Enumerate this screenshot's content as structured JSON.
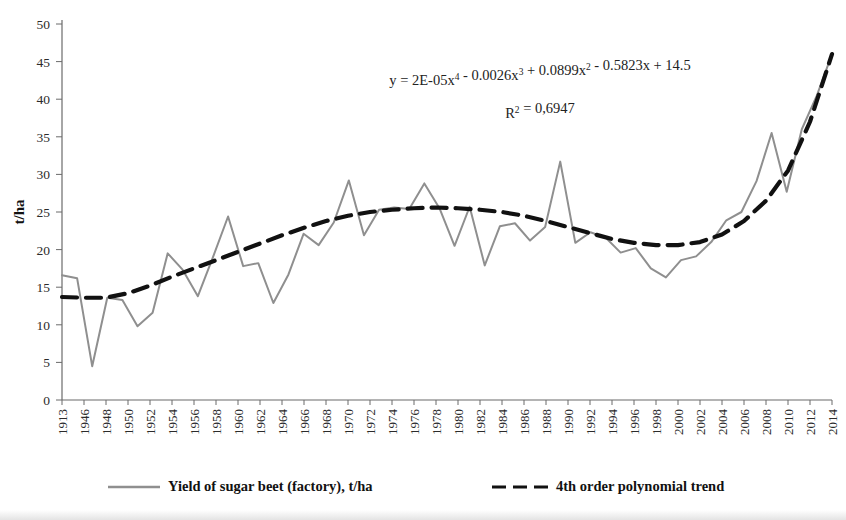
{
  "chart_data": {
    "type": "line",
    "title": "",
    "xlabel": "",
    "ylabel": "t/ha",
    "ylim": [
      0,
      50
    ],
    "ytick_step": 5,
    "yticks": [
      0,
      5,
      10,
      15,
      20,
      25,
      30,
      35,
      40,
      45,
      50
    ],
    "grid": false,
    "legend_position": "bottom",
    "categories": [
      "1913",
      "1946",
      "1948",
      "1950",
      "1952",
      "1954",
      "1956",
      "1958",
      "1960",
      "1962",
      "1964",
      "1966",
      "1968",
      "1970",
      "1972",
      "1974",
      "1976",
      "1978",
      "1980",
      "1982",
      "1984",
      "1986",
      "1988",
      "1990",
      "1992",
      "1994",
      "1996",
      "1998",
      "2000",
      "2002",
      "2004",
      "2006",
      "2008",
      "2010",
      "2012",
      "2014"
    ],
    "series": [
      {
        "name": "Yield of sugar beet (factory), t/ha",
        "color": "#8f8f8f",
        "style": "solid",
        "values": [
          16.6,
          16.2,
          4.5,
          13.6,
          13.3,
          9.8,
          11.6,
          19.5,
          17.3,
          13.8,
          19.0,
          24.4,
          17.8,
          18.2,
          12.9,
          16.7,
          22.1,
          20.6,
          23.6,
          29.2,
          21.9,
          25.3,
          25.6,
          25.4,
          28.8,
          25.5,
          20.5,
          25.7,
          17.9,
          23.1,
          23.5,
          21.2,
          23.0,
          31.7,
          20.9,
          22.3
        ]
      },
      {
        "name": "4th order polynomial trend",
        "color": "#111111",
        "style": "dashed",
        "values": [
          13.7,
          13.6,
          13.6,
          14.2,
          15.2,
          16.4,
          17.5,
          18.6,
          19.7,
          20.8,
          21.9,
          22.9,
          23.8,
          24.5,
          25.0,
          25.3,
          25.5,
          25.6,
          25.5,
          25.3,
          25.0,
          24.5,
          23.8,
          23.0,
          22.2,
          21.4,
          20.9,
          20.6,
          20.6,
          21.0,
          22.0,
          23.8,
          26.5,
          30.5,
          37.0,
          46.0
        ]
      }
    ],
    "series_extra_note": "observed series continues with additional points beyond listed even-year ticks",
    "observed_full": [
      16.6,
      16.2,
      4.5,
      13.6,
      13.3,
      9.8,
      11.6,
      19.5,
      17.3,
      13.8,
      19.0,
      24.4,
      17.8,
      18.2,
      12.9,
      16.7,
      22.1,
      20.6,
      23.6,
      29.2,
      21.9,
      25.3,
      25.6,
      25.4,
      28.8,
      25.5,
      20.5,
      25.7,
      17.9,
      23.1,
      23.5,
      21.2,
      23.0,
      31.7,
      20.9,
      22.3,
      21.6,
      19.6,
      20.2,
      17.5,
      16.3,
      18.6,
      19.1,
      21.0,
      23.9,
      25.0,
      29.1,
      35.5,
      27.7,
      36.0,
      40.5,
      46.0
    ],
    "annotations": {
      "equation": {
        "line1_parts": [
          {
            "text": "y = 2E-05x",
            "sup": false
          },
          {
            "text": "4",
            "sup": true
          },
          {
            "text": " - 0.0026x",
            "sup": false
          },
          {
            "text": "3",
            "sup": true
          },
          {
            "text": " + 0.0899x",
            "sup": false
          },
          {
            "text": "2",
            "sup": true
          },
          {
            "text": " - 0.5823x + 14.5",
            "sup": false
          }
        ],
        "line1_plain": "y = 2E-05x4 - 0.0026x3 + 0.0899x2 - 0.5823x + 14.5",
        "line2_parts": [
          {
            "text": "R",
            "sup": false
          },
          {
            "text": "2",
            "sup": true
          },
          {
            "text": " = 0,6947",
            "sup": false
          }
        ],
        "line2_plain": "R2 = 0,6947"
      }
    }
  },
  "axis": {
    "y_title": "t/ha",
    "y_tick_labels": [
      "50",
      "45",
      "40",
      "35",
      "30",
      "25",
      "20",
      "15",
      "10",
      "5",
      "0"
    ],
    "x_tick_labels": [
      "1913",
      "1946",
      "1948",
      "1950",
      "1952",
      "1954",
      "1956",
      "1958",
      "1960",
      "1962",
      "1964",
      "1966",
      "1968",
      "1970",
      "1972",
      "1974",
      "1976",
      "1978",
      "1980",
      "1982",
      "1984",
      "1986",
      "1988",
      "1990",
      "1992",
      "1994",
      "1996",
      "1998",
      "2000",
      "2002",
      "2004",
      "2006",
      "2008",
      "2010",
      "2012",
      "2014"
    ]
  },
  "legend": {
    "items": [
      {
        "label": "Yield of sugar beet (factory), t/ha",
        "color": "#8f8f8f",
        "style": "solid"
      },
      {
        "label": "4th order polynomial trend",
        "color": "#111111",
        "style": "dashed"
      }
    ]
  },
  "colors": {
    "observed_line": "#8f8f8f",
    "trend_line": "#111111",
    "axis": "#595959",
    "text": "#1a1a1a",
    "background": "#ffffff"
  }
}
